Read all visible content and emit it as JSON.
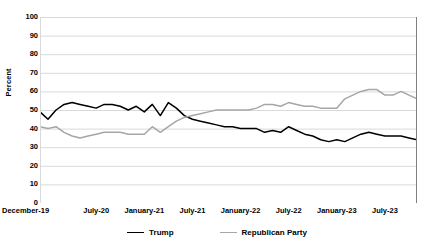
{
  "chart_data": {
    "type": "line",
    "title": "",
    "xlabel": "",
    "ylabel": "Percent",
    "ylim": [
      0,
      100
    ],
    "ytick_step": 10,
    "yticks": [
      100,
      90,
      80,
      70,
      60,
      50,
      40,
      30,
      20,
      10,
      0
    ],
    "grid": true,
    "legend_position": "bottom",
    "xtick_labels": [
      "December-19",
      "July-20",
      "January-21",
      "July-21",
      "January-22",
      "July-22",
      "January-23",
      "July-23"
    ],
    "xtick_indices": [
      0,
      7,
      13,
      19,
      25,
      31,
      37,
      43
    ],
    "x_count": 48,
    "series": [
      {
        "name": "Trump",
        "color": "#000000",
        "values": [
          49,
          45,
          50,
          53,
          54,
          53,
          52,
          51,
          53,
          53,
          52,
          50,
          52,
          49,
          53,
          47,
          54,
          51,
          47,
          45,
          44,
          43,
          42,
          41,
          41,
          40,
          40,
          40,
          38,
          39,
          38,
          41,
          39,
          37,
          36,
          34,
          33,
          34,
          33,
          35,
          37,
          38,
          37,
          36,
          36,
          36,
          35,
          34
        ]
      },
      {
        "name": "Republican Party",
        "color": "#a6a6a6",
        "values": [
          41,
          40,
          41,
          38,
          36,
          35,
          36,
          37,
          38,
          38,
          38,
          37,
          37,
          37,
          41,
          38,
          41,
          44,
          46,
          47,
          48,
          49,
          50,
          50,
          50,
          50,
          50,
          51,
          53,
          53,
          52,
          54,
          53,
          52,
          52,
          51,
          51,
          51,
          56,
          58,
          60,
          61,
          61,
          58,
          58,
          60,
          58,
          56
        ]
      }
    ]
  },
  "legend": {
    "entries": [
      {
        "label": "Trump"
      },
      {
        "label": "Republican Party"
      }
    ]
  },
  "axis": {
    "y_title": "Percent"
  },
  "colors": {
    "trump_line": "#000000",
    "republican_line": "#a6a6a6",
    "grid": "#d9d9d9",
    "frame": "#808080",
    "background": "#ffffff"
  }
}
